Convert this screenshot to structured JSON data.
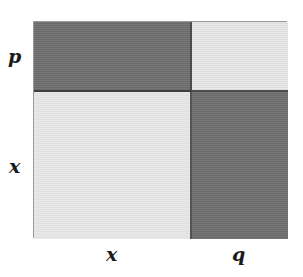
{
  "diagram": {
    "type": "area-model",
    "labels": {
      "left_top": "p",
      "left_bottom": "x",
      "bottom_left": "x",
      "bottom_right": "q"
    },
    "cells": [
      {
        "id": "top-left",
        "term": "px",
        "shade": "dark",
        "color": "#6f6f6f"
      },
      {
        "id": "top-right",
        "term": "pq",
        "shade": "light",
        "color": "#e6e6e6"
      },
      {
        "id": "bottom-left",
        "term": "x2",
        "shade": "light",
        "color": "#e8e8e8"
      },
      {
        "id": "bottom-right",
        "term": "qx",
        "shade": "dark",
        "color": "#6f6f6f"
      }
    ],
    "colors": {
      "dark_fill": "#6f6f6f",
      "light_fill": "#e8e8e8",
      "divider": "#4c4c4c",
      "outer_border": "#9a9a9a",
      "text": "#1b1b1b",
      "background": "#ffffff"
    }
  }
}
